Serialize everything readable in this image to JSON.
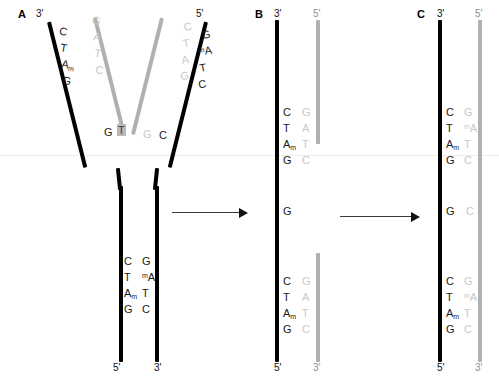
{
  "figure": {
    "panels": [
      {
        "id": "A",
        "label": "A"
      },
      {
        "id": "B",
        "label": "B"
      },
      {
        "id": "C",
        "label": "C"
      }
    ]
  },
  "panel_a": {
    "label": "A",
    "ends": {
      "top_left": "3'",
      "top_right": "5'",
      "bottom_left": "5'",
      "bottom_right": "3'"
    },
    "left_arm": {
      "parent_strand_bases": [
        "C",
        "T",
        "A",
        "G"
      ],
      "parent_methyl_index": 2,
      "daughter_strand_bases": [
        "G",
        "A",
        "T",
        "C"
      ]
    },
    "right_arm": {
      "daughter_strand_bases": [
        "C",
        "T",
        "A",
        "G"
      ],
      "parent_strand_bases": [
        "G",
        "A",
        "T",
        "C"
      ],
      "parent_methyl_index": 1
    },
    "fork_junction": {
      "left_black": "G",
      "mismatch": "T",
      "right_gray": "G",
      "right_black": "C"
    },
    "stem": {
      "left_bases": [
        "C",
        "T",
        "A",
        "G"
      ],
      "left_methyl_index": 2,
      "right_bases": [
        "G",
        "A",
        "T",
        "C"
      ],
      "right_methyl_index": 1
    }
  },
  "panel_b": {
    "label": "B",
    "ends": {
      "top_left": "3'",
      "top_right": "5'",
      "bottom_left": "5'",
      "bottom_right": "3'"
    },
    "top": {
      "left_bases": [
        "C",
        "T",
        "A",
        "G"
      ],
      "left_methyl_index": 2,
      "right_bases": [
        "G",
        "A",
        "T",
        "C"
      ]
    },
    "gap": {
      "left_base": "G"
    },
    "bottom": {
      "left_bases": [
        "C",
        "T",
        "A",
        "G"
      ],
      "left_methyl_index": 2,
      "right_bases": [
        "G",
        "A",
        "T",
        "C"
      ]
    }
  },
  "panel_c": {
    "label": "C",
    "ends": {
      "top_left": "3'",
      "top_right": "5'",
      "bottom_left": "5'",
      "bottom_right": "3'"
    },
    "top": {
      "left_bases": [
        "C",
        "T",
        "A",
        "G"
      ],
      "left_methyl_index": 2,
      "right_bases": [
        "G",
        "A",
        "T",
        "C"
      ],
      "right_methyl_index": 1
    },
    "middle": {
      "left_base": "G",
      "right_base": "C"
    },
    "bottom": {
      "left_bases": [
        "C",
        "T",
        "A",
        "G"
      ],
      "left_methyl_index": 2,
      "right_bases": [
        "G",
        "A",
        "T",
        "C"
      ],
      "right_methyl_index": 1
    }
  },
  "arrows": {
    "first": "arrow-a-to-b",
    "second": "arrow-b-to-c"
  },
  "colors": {
    "parent_strand": "#000000",
    "daughter_strand": "#b0b0b0",
    "base_text": "#1a1a1a",
    "base_text_gray": "#c8c8c8",
    "mismatch_highlight": "#b8b8b8"
  }
}
